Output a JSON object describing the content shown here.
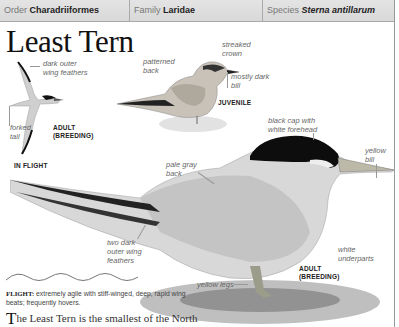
{
  "header": {
    "order": {
      "label": "Order",
      "value": "Charadriiformes"
    },
    "family": {
      "label": "Family",
      "value": "Laridae"
    },
    "species": {
      "label": "Species",
      "value": "Sterna antillarum"
    }
  },
  "title": "Least Tern",
  "illustrations": {
    "in_flight": {
      "caption": "IN FLIGHT",
      "tag_line1": "ADULT",
      "tag_line2": "(BREEDING)",
      "labels": {
        "wing_1": "dark outer",
        "wing_2": "wing feathers",
        "tail_1": "forked",
        "tail_2": "tail"
      }
    },
    "juvenile": {
      "tag": "JUVENILE",
      "labels": {
        "back_1": "patterned",
        "back_2": "back",
        "crown_1": "streaked",
        "crown_2": "crown",
        "bill_1": "mostly dark",
        "bill_2": "bill"
      }
    },
    "adult": {
      "tag_line1": "ADULT",
      "tag_line2": "(BREEDING)",
      "labels": {
        "cap_1": "black cap with",
        "cap_2": "white forehead",
        "bill_1": "yellow",
        "bill_2": "bill",
        "back_1": "pale gray",
        "back_2": "back",
        "wing_1": "two dark",
        "wing_2": "outer wing",
        "wing_3": "feathers",
        "under_1": "white",
        "under_2": "underparts",
        "legs": "yellow legs"
      }
    }
  },
  "flight": {
    "label": "FLIGHT:",
    "text": "extremely agile with stiff-winged, deep, rapid wing beats; frequently hovers."
  },
  "body_text": {
    "dropcap": "T",
    "rest": "he Least Tern is the smallest of the North"
  },
  "colors": {
    "header_bg": "#dcdcdc",
    "rule": "#999999",
    "text": "#222222",
    "label": "#666666"
  }
}
